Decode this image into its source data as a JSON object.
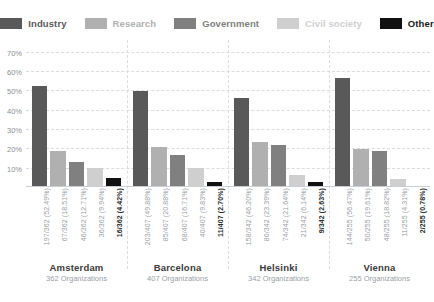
{
  "legend": {
    "items": [
      {
        "label": "Industry",
        "color": "#595959"
      },
      {
        "label": "Research",
        "color": "#b0b0b0"
      },
      {
        "label": "Government",
        "color": "#808080"
      },
      {
        "label": "Civil society",
        "color": "#cfcfcf"
      },
      {
        "label": "Other",
        "color": "#111111"
      }
    ]
  },
  "axis": {
    "yticks": [
      "10%",
      "20%",
      "30%",
      "40%",
      "50%",
      "60%",
      "70%"
    ],
    "ytick_values": [
      10,
      20,
      30,
      40,
      50,
      60,
      70
    ]
  },
  "cities": [
    {
      "name": "Amsterdam",
      "sub": "362 Organizations"
    },
    {
      "name": "Barcelona",
      "sub": "407 Organizations"
    },
    {
      "name": "Helsinki",
      "sub": "342 Organizations"
    },
    {
      "name": "Vienna",
      "sub": "255 Organizations"
    }
  ],
  "labels": {
    "Amsterdam": [
      "197/362 (52.49%)",
      "67/362 (18.51%)",
      "46/362 (12.71%)",
      "36/362 (9.94%)",
      "16/362 (4.42%)"
    ],
    "Barcelona": [
      "203/407 (49.88%)",
      "85/407 (20.88%)",
      "68/407 (16.71%)",
      "40/407 (9.83%)",
      "11/407 (2.70%)"
    ],
    "Helsinki": [
      "158/342 (46.20%)",
      "80/342 (23.39%)",
      "74/342 (21.64%)",
      "21/342 (6.14%)",
      "9/342 (2.63%)"
    ],
    "Vienna": [
      "144/255 (56.47%)",
      "50/255 (19.61%)",
      "48/255 (18.82%)",
      "11/255 (4.31%)",
      "2/255 (0.78%)"
    ]
  },
  "chart_data": {
    "type": "bar",
    "title": "",
    "xlabel": "",
    "ylabel": "",
    "ylim": [
      0,
      73
    ],
    "grid": true,
    "legend_position": "top",
    "categories": [
      "Amsterdam",
      "Barcelona",
      "Helsinki",
      "Vienna"
    ],
    "category_totals": [
      362,
      407,
      342,
      255
    ],
    "series": [
      {
        "name": "Industry",
        "color": "#595959",
        "values": [
          52.49,
          49.88,
          46.2,
          56.47
        ],
        "counts": [
          197,
          203,
          158,
          144
        ]
      },
      {
        "name": "Research",
        "color": "#b0b0b0",
        "values": [
          18.51,
          20.88,
          23.39,
          19.61
        ],
        "counts": [
          67,
          85,
          80,
          50
        ]
      },
      {
        "name": "Government",
        "color": "#808080",
        "values": [
          12.71,
          16.71,
          21.64,
          18.82
        ],
        "counts": [
          46,
          68,
          74,
          48
        ]
      },
      {
        "name": "Civil society",
        "color": "#cfcfcf",
        "values": [
          9.94,
          9.83,
          6.14,
          4.31
        ],
        "counts": [
          36,
          40,
          21,
          11
        ]
      },
      {
        "name": "Other",
        "color": "#111111",
        "values": [
          4.42,
          2.7,
          2.63,
          0.78
        ],
        "counts": [
          16,
          11,
          9,
          2
        ]
      }
    ]
  }
}
